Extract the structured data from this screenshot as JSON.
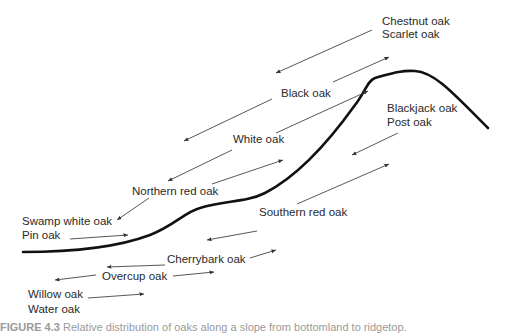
{
  "figure": {
    "type": "diagram",
    "caption": {
      "label": "FIGURE 4.3",
      "text": "Relative distribution of oaks along a slope from bottomland to ridgetop."
    },
    "labels": [
      {
        "id": "chestnut-oak",
        "text": "Chestnut oak",
        "x": 382,
        "y": 15
      },
      {
        "id": "scarlet-oak",
        "text": "Scarlet oak",
        "x": 382,
        "y": 28
      },
      {
        "id": "black-oak",
        "text": "Black oak",
        "x": 281,
        "y": 87
      },
      {
        "id": "blackjack-oak",
        "text": "Blackjack oak",
        "x": 387,
        "y": 102
      },
      {
        "id": "post-oak",
        "text": "Post oak",
        "x": 387,
        "y": 116
      },
      {
        "id": "white-oak",
        "text": "White oak",
        "x": 233,
        "y": 133
      },
      {
        "id": "northern-red-oak",
        "text": "Northern red oak",
        "x": 132,
        "y": 185
      },
      {
        "id": "southern-red-oak",
        "text": "Southern red oak",
        "x": 259,
        "y": 206
      },
      {
        "id": "swamp-white-oak",
        "text": "Swamp white oak",
        "x": 22,
        "y": 215
      },
      {
        "id": "pin-oak",
        "text": "Pin oak",
        "x": 22,
        "y": 229
      },
      {
        "id": "cherrybark-oak",
        "text": "Cherrybark oak",
        "x": 167,
        "y": 253
      },
      {
        "id": "overcup-oak",
        "text": "Overcup oak",
        "x": 102,
        "y": 270
      },
      {
        "id": "willow-oak",
        "text": "Willow oak",
        "x": 28,
        "y": 288
      },
      {
        "id": "water-oak",
        "text": "Water oak",
        "x": 28,
        "y": 303
      }
    ],
    "terrain_profile": {
      "stroke": "#111111",
      "stroke_width": 2.6,
      "path": "M 23 252 C 60 252, 110 250, 150 235 C 175 225, 185 212, 200 208 C 225 200, 245 203, 265 193 C 300 175, 330 140, 355 105 C 365 92, 368 80, 375 78 C 390 74, 400 70, 415 71 C 435 72, 455 95, 488 128"
    },
    "arrows": [
      {
        "from": [
          372,
          30
        ],
        "to": [
          276,
          73
        ]
      },
      {
        "from": [
          333,
          82
        ],
        "to": [
          389,
          57
        ]
      },
      {
        "from": [
          272,
          99
        ],
        "to": [
          184,
          141
        ]
      },
      {
        "from": [
          276,
          133
        ],
        "to": [
          368,
          91
        ]
      },
      {
        "from": [
          232,
          150
        ],
        "to": [
          168,
          181
        ]
      },
      {
        "from": [
          212,
          184
        ],
        "to": [
          283,
          160
        ]
      },
      {
        "from": [
          149,
          198
        ],
        "to": [
          117,
          220
        ]
      },
      {
        "from": [
          70,
          239
        ],
        "to": [
          128,
          235
        ]
      },
      {
        "from": [
          398,
          133
        ],
        "to": [
          352,
          155
        ]
      },
      {
        "from": [
          297,
          204
        ],
        "to": [
          389,
          164
        ]
      },
      {
        "from": [
          257,
          231
        ],
        "to": [
          207,
          240
        ]
      },
      {
        "from": [
          250,
          258
        ],
        "to": [
          276,
          250
        ]
      },
      {
        "from": [
          165,
          265
        ],
        "to": [
          107,
          267
        ]
      },
      {
        "from": [
          96,
          275
        ],
        "to": [
          55,
          280
        ]
      },
      {
        "from": [
          173,
          276
        ],
        "to": [
          214,
          272
        ]
      },
      {
        "from": [
          88,
          298
        ],
        "to": [
          144,
          294
        ]
      }
    ],
    "colors": {
      "background": "#ffffff",
      "text": "#2a2a2a",
      "arrow": "#444444",
      "curve": "#111111"
    }
  }
}
